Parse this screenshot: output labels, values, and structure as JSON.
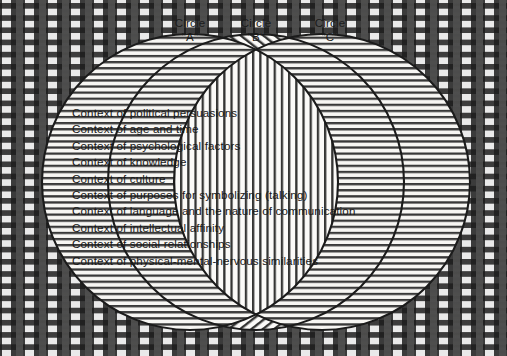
{
  "figure": {
    "type": "venn-diagram",
    "circle_labels": [
      {
        "name": "Circle",
        "id": "\"A\""
      },
      {
        "name": "Circle",
        "id": "\"B\""
      },
      {
        "name": "Circle",
        "id": "\"C\""
      }
    ],
    "context_lines": [
      "Context of political persuasions",
      "Context of age and time",
      "Context of psychological factors",
      "Context of knowledge",
      "Context of culture",
      "Context of purposes for symbolizing (talking)",
      "Context of language and the nature of communication",
      "Context of intellectual affinity",
      "Context of social relationships",
      "Context of physical-mental-nervous similarities"
    ],
    "colors": {
      "ink": "#1b1b1b",
      "paper": "#f2f1ee",
      "hatch": "#2a2a2a"
    }
  }
}
